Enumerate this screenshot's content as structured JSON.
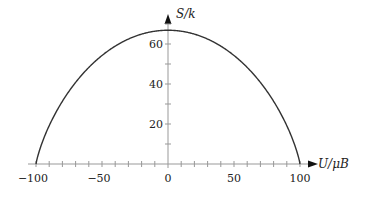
{
  "chart_data": {
    "type": "line",
    "title": "",
    "xlabel": "U/μB",
    "ylabel": "S/k",
    "xlim": [
      -100,
      100
    ],
    "ylim": [
      0,
      70
    ],
    "grid": false,
    "legend": null,
    "x_ticks": [
      -100,
      -50,
      0,
      50,
      100
    ],
    "x_tick_labels": [
      "−100",
      "−50",
      "0",
      "50",
      "100"
    ],
    "x_minor_tick_step": 10,
    "y_ticks": [
      20,
      40,
      60
    ],
    "y_tick_labels": [
      "20",
      "40",
      "60"
    ],
    "y_minor_tick_step": 10,
    "series": [
      {
        "name": "S/k vs U/μB (two-state paramagnet, N=100)",
        "x": [
          -100,
          -90,
          -80,
          -70,
          -60,
          -50,
          -40,
          -30,
          -20,
          -10,
          0,
          10,
          20,
          30,
          40,
          50,
          60,
          70,
          80,
          90,
          100
        ],
        "y": [
          0,
          19.9,
          32.5,
          42.2,
          50.0,
          56.2,
          61.1,
          64.7,
          67.3,
          68.8,
          69.3,
          68.8,
          67.3,
          64.7,
          61.1,
          56.2,
          50.0,
          42.2,
          32.5,
          19.9,
          0
        ],
        "color": "#333333"
      }
    ]
  },
  "plot": {
    "origin_px": [
      168,
      164
    ],
    "x_scale_px_per_unit": 1.32,
    "y_scale_px_per_unit": 2.0
  }
}
